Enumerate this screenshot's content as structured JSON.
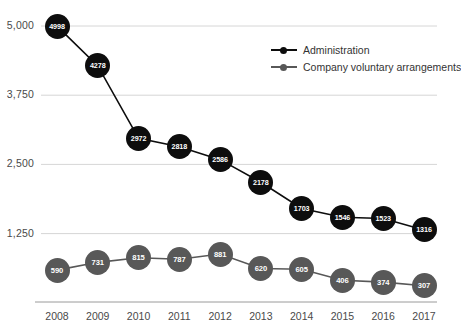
{
  "chart_data": {
    "type": "line",
    "title": "",
    "subtitle": "",
    "xlabel": "",
    "ylabel": "",
    "categories": [
      "2008",
      "2009",
      "2010",
      "2011",
      "2012",
      "2013",
      "2014",
      "2015",
      "2016",
      "2017"
    ],
    "series": [
      {
        "name": "Administration",
        "color": "#0d0d0d",
        "values": [
          4998,
          4278,
          2972,
          2818,
          2586,
          2178,
          1703,
          1546,
          1523,
          1316
        ]
      },
      {
        "name": "Company voluntary arrangements",
        "color": "#585858",
        "values": [
          590,
          731,
          815,
          787,
          881,
          620,
          605,
          406,
          374,
          307
        ]
      }
    ],
    "ylim": [
      0,
      5000
    ],
    "yticks": [
      5000,
      3750,
      2500,
      1250
    ],
    "ytick_labels": [
      "5,000",
      "3,750",
      "2,500",
      "1,250"
    ],
    "grid": true,
    "legend_position": "top-right",
    "data_labels": true
  },
  "legend": {
    "items": [
      {
        "label": "Administration",
        "marker": "legend-marker-administration"
      },
      {
        "label": "Company voluntary arrangements",
        "marker": "legend-marker-cva"
      }
    ]
  }
}
